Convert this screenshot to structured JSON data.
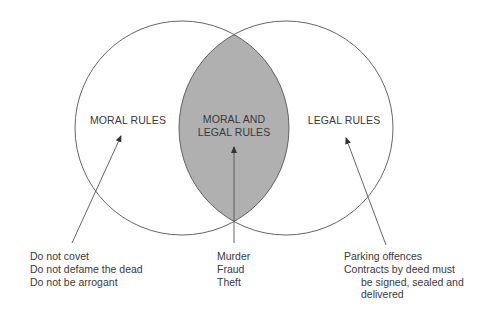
{
  "diagram": {
    "type": "venn",
    "colors": {
      "stroke": "#555555",
      "intersection_fill": "#b0b0b0",
      "background": "#ffffff",
      "text": "#3a3a3a"
    },
    "sets": {
      "left": {
        "label": "MORAL RULES",
        "examples": [
          "Do not covet",
          "Do not defame the dead",
          "Do not be arrogant"
        ]
      },
      "intersection": {
        "label_line1": "MORAL AND",
        "label_line2": "LEGAL RULES",
        "examples": [
          "Murder",
          "Fraud",
          "Theft"
        ]
      },
      "right": {
        "label": "LEGAL RULES",
        "examples": [
          "Parking offences",
          "Contracts by deed must",
          "be signed, sealed and",
          "delivered"
        ]
      }
    }
  }
}
